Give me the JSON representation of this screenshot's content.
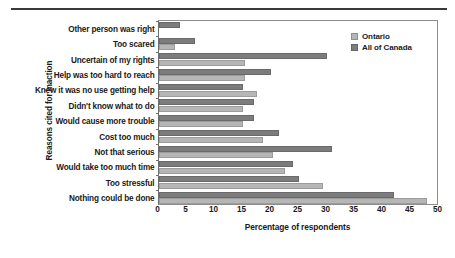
{
  "chart_data": {
    "type": "bar",
    "orientation": "horizontal",
    "title": "",
    "xlabel": "Percentage of respondents",
    "ylabel": "Reasons cited for inaction",
    "xlim": [
      0,
      50
    ],
    "xticks": [
      0,
      5,
      10,
      15,
      20,
      25,
      30,
      35,
      40,
      45,
      50
    ],
    "grid": false,
    "legend_position": "top-right",
    "categories": [
      "Other person was right",
      "Too scared",
      "Uncertain of my rights",
      "Help was too hard to reach",
      "Knew it was no use getting help",
      "Didn't know what to do",
      "Would cause more trouble",
      "Cost too much",
      "Not that serious",
      "Would take too much time",
      "Too stressful",
      "Nothing could be done"
    ],
    "series": [
      {
        "name": "Ontario",
        "color": "#b6b6b6",
        "values": [
          0,
          3.0,
          15.5,
          15.5,
          17.5,
          15.0,
          15.0,
          18.6,
          20.4,
          22.5,
          29.4,
          47.9
        ]
      },
      {
        "name": "All of Canada",
        "color": "#7c7c7c",
        "values": [
          3.8,
          6.6,
          30.0,
          20.0,
          15.0,
          17.0,
          17.0,
          21.6,
          30.9,
          24.0,
          25.1,
          42.0
        ]
      }
    ]
  },
  "legend": {
    "items": [
      {
        "label": "Ontario",
        "swatch": "ontario"
      },
      {
        "label": "All of Canada",
        "swatch": "canada"
      }
    ]
  }
}
